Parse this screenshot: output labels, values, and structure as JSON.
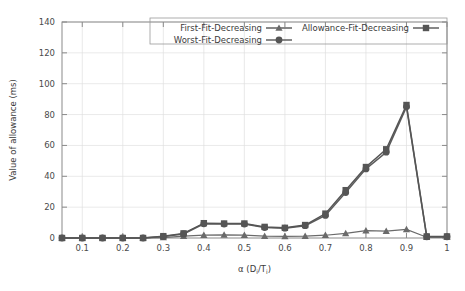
{
  "chart_data": {
    "type": "line",
    "title": "",
    "xlabel": "α (Di/Ti)",
    "xlabel_main": "α (D",
    "xlabel_sub1": "i",
    "xlabel_mid": "/T",
    "xlabel_sub2": "i",
    "xlabel_end": ")",
    "ylabel": "Value of allowance (ms)",
    "xlim": [
      0.05,
      1.0
    ],
    "ylim": [
      0,
      140
    ],
    "grid": true,
    "legend_position": "top-inside",
    "x": [
      0.05,
      0.1,
      0.15,
      0.2,
      0.25,
      0.3,
      0.35,
      0.4,
      0.45,
      0.5,
      0.55,
      0.6,
      0.65,
      0.7,
      0.75,
      0.8,
      0.85,
      0.9,
      0.95,
      1.0
    ],
    "xticks": [
      0.1,
      0.2,
      0.3,
      0.4,
      0.5,
      0.6,
      0.7,
      0.8,
      0.9,
      1.0
    ],
    "xticklabels": [
      "0.1",
      "0.2",
      "0.3",
      "0.4",
      "0.5",
      "0.6",
      "0.7",
      "0.8",
      "0.9",
      "1"
    ],
    "yticks": [
      0,
      20,
      40,
      60,
      80,
      100,
      120,
      140
    ],
    "yticklabels": [
      "0",
      "20",
      "40",
      "60",
      "80",
      "100",
      "120",
      "140"
    ],
    "series": [
      {
        "name": "First-Fit-Decreasing",
        "marker": "triangle",
        "color": "#6a6a6a",
        "values": [
          0,
          0,
          0,
          0,
          0,
          0.3,
          1.2,
          1.8,
          2.0,
          1.8,
          1.2,
          1.0,
          1.2,
          1.8,
          3.0,
          4.8,
          4.4,
          5.6,
          0.5,
          0.6
        ]
      },
      {
        "name": "Worst-Fit-Decreasing",
        "marker": "circle",
        "color": "#555555",
        "values": [
          0,
          0,
          0,
          0,
          0,
          1.0,
          2.6,
          9.2,
          9.0,
          9.0,
          6.8,
          6.4,
          8.0,
          14.6,
          29.5,
          44.8,
          55.6,
          85.0,
          0.8,
          0.8
        ]
      },
      {
        "name": "Allowance-Fit-Decreasing",
        "marker": "square",
        "color": "#555555",
        "values": [
          0,
          0,
          0,
          0,
          0,
          1.2,
          3.0,
          9.6,
          9.4,
          9.4,
          7.2,
          6.6,
          8.4,
          15.8,
          31.0,
          46.0,
          57.5,
          86.2,
          1.0,
          1.0
        ]
      }
    ],
    "legend": [
      {
        "label": "First-Fit-Decreasing",
        "marker": "triangle"
      },
      {
        "label": "Allowance-Fit-Decreasing",
        "marker": "square"
      },
      {
        "label": "Worst-Fit-Decreasing",
        "marker": "circle"
      }
    ]
  }
}
